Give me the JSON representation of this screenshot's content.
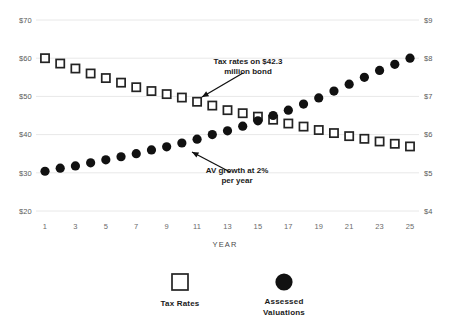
{
  "chart_data": {
    "type": "scatter",
    "title": "",
    "xlabel": "YEAR",
    "ylabel": "",
    "grid": true,
    "legend_position": "bottom",
    "x": [
      1,
      2,
      3,
      4,
      5,
      6,
      7,
      8,
      9,
      10,
      11,
      12,
      13,
      14,
      15,
      16,
      17,
      18,
      19,
      20,
      21,
      22,
      23,
      24,
      25
    ],
    "x_tick_labels": [
      "1",
      "3",
      "5",
      "7",
      "9",
      "11",
      "13",
      "15",
      "17",
      "19",
      "21",
      "23",
      "25"
    ],
    "x_ticks": [
      1,
      3,
      5,
      7,
      9,
      11,
      13,
      15,
      17,
      19,
      21,
      23,
      25
    ],
    "left_axis": {
      "label": "",
      "ylim": [
        20,
        70
      ],
      "tick_labels": [
        "$70",
        "$60",
        "$50",
        "$40",
        "$30",
        "$20"
      ],
      "ticks": [
        70,
        60,
        50,
        40,
        30,
        20
      ]
    },
    "right_axis": {
      "label": "",
      "ylim": [
        4,
        9
      ],
      "tick_labels": [
        "$9",
        "$8",
        "$7",
        "$6",
        "$5",
        "$4"
      ],
      "ticks": [
        9,
        8,
        7,
        6,
        5,
        4
      ]
    },
    "series": [
      {
        "name": "Tax Rates",
        "axis": "left",
        "marker": "open-square",
        "color": "#232323",
        "values": [
          60.0,
          58.6,
          57.3,
          56.0,
          54.8,
          53.6,
          52.4,
          51.4,
          50.6,
          49.7,
          48.6,
          47.6,
          46.4,
          45.6,
          44.7,
          43.9,
          42.9,
          42.1,
          41.2,
          40.4,
          39.6,
          38.9,
          38.2,
          37.6,
          36.9
        ]
      },
      {
        "name": "Assessed Valuations",
        "axis": "right",
        "marker": "filled-circle",
        "color": "#111111",
        "values": [
          5.04,
          5.12,
          5.18,
          5.26,
          5.34,
          5.42,
          5.5,
          5.6,
          5.68,
          5.78,
          5.88,
          6.0,
          6.1,
          6.22,
          6.36,
          6.5,
          6.64,
          6.8,
          6.96,
          7.14,
          7.32,
          7.5,
          7.68,
          7.84,
          8.0
        ]
      }
    ],
    "annotations": [
      {
        "id": "tax-rates-annotation",
        "text_line1": "Tax rates on $42.3",
        "text_line2": "million bond",
        "text_x": 248,
        "text_y": 64,
        "arrow_from_x": 243,
        "arrow_from_y": 73,
        "arrow_to_x": 202,
        "arrow_to_y": 97
      },
      {
        "id": "av-growth-annotation",
        "text_line1": "AV growth at 2%",
        "text_line2": "per year",
        "text_x": 237,
        "text_y": 173,
        "arrow_from_x": 230,
        "arrow_from_y": 172,
        "arrow_to_x": 192,
        "arrow_to_y": 152
      }
    ],
    "legend": [
      {
        "label": "Tax Rates",
        "marker": "open-square"
      },
      {
        "label": "Assessed",
        "label2": "Valuations",
        "marker": "filled-circle"
      }
    ]
  },
  "legend": {
    "tax_rates_label": "Tax Rates",
    "assessed_label_line1": "Assessed",
    "assessed_label_line2": "Valuations"
  },
  "axis": {
    "x_title": "YEAR"
  }
}
